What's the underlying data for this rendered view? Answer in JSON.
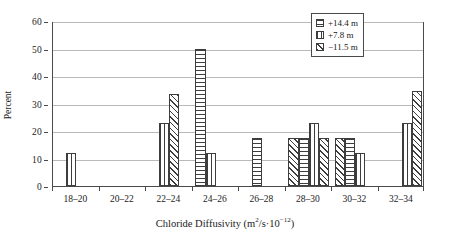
{
  "chart_data": {
    "type": "bar",
    "title": "",
    "subtitle": "",
    "xlabel_text": "Chloride Diffusivity (m2/s·10-12)",
    "xlabel_prefix": "Chloride Diffusivity (m",
    "xlabel_sup1": "2",
    "xlabel_mid": "/s",
    "xlabel_dot": "·",
    "xlabel_ten": "10",
    "xlabel_sup2": "−12",
    "xlabel_suffix": ")",
    "ylabel": "Percent",
    "categories": [
      "18–20",
      "20–22",
      "22–24",
      "24–26",
      "26–28",
      "28–30",
      "30–32",
      "32–34"
    ],
    "ylim": [
      0,
      60
    ],
    "yticks": [
      0,
      10,
      20,
      30,
      40,
      50,
      60
    ],
    "ytick_labels": [
      "0",
      "10",
      "20",
      "30",
      "40",
      "50",
      "60"
    ],
    "grid": true,
    "grid_axis": "y",
    "legend_position": "top-right",
    "series": [
      {
        "name": "+14.4 m",
        "pattern": "horizontal",
        "values": [
          0,
          0,
          0,
          50,
          17.5,
          17.5,
          17.5,
          0
        ]
      },
      {
        "name": "+7.8 m",
        "pattern": "vertical",
        "values": [
          12,
          0,
          23,
          12,
          0,
          23,
          12,
          23
        ]
      },
      {
        "name": "−11.5 m",
        "pattern": "diagonal",
        "values": [
          0,
          0,
          33.5,
          0,
          0,
          17.5,
          17.5,
          34.5
        ]
      }
    ],
    "bars": [
      {
        "group": "18–20",
        "series": "+7.8 m",
        "pattern": "vertical",
        "value": 12,
        "slot": 1
      },
      {
        "group": "22–24",
        "series": "+7.8 m",
        "pattern": "vertical",
        "value": 23,
        "slot": 1
      },
      {
        "group": "22–24",
        "series": "−11.5 m",
        "pattern": "diagonal",
        "value": 33.5,
        "slot": 2
      },
      {
        "group": "24–26",
        "series": "+14.4 m",
        "pattern": "horizontal",
        "value": 50,
        "slot": 0
      },
      {
        "group": "24–26",
        "series": "+7.8 m",
        "pattern": "vertical",
        "value": 12,
        "slot": 1
      },
      {
        "group": "26–28",
        "series": "+14.4 m",
        "pattern": "horizontal",
        "value": 17.5,
        "slot": 1
      },
      {
        "group": "28–30",
        "series": "−11.5 m",
        "pattern": "diagonal",
        "value": 17.5,
        "slot": 0
      },
      {
        "group": "28–30",
        "series": "+14.4 m",
        "pattern": "horizontal",
        "value": 17.5,
        "slot": 1
      },
      {
        "group": "28–30",
        "series": "+7.8 m",
        "pattern": "vertical",
        "value": 23,
        "slot": 2
      },
      {
        "group": "28–30",
        "series": "−11.5 m",
        "pattern": "diagonal",
        "value": 17.5,
        "slot": 3
      },
      {
        "group": "30–32",
        "series": "−11.5 m",
        "pattern": "diagonal",
        "value": 17.5,
        "slot": 0
      },
      {
        "group": "30–32",
        "series": "+14.4 m",
        "pattern": "horizontal",
        "value": 17.5,
        "slot": 1
      },
      {
        "group": "30–32",
        "series": "+7.8 m",
        "pattern": "vertical",
        "value": 12,
        "slot": 2
      },
      {
        "group": "32–34",
        "series": "+7.8 m",
        "pattern": "vertical",
        "value": 23,
        "slot": 2
      },
      {
        "group": "32–34",
        "series": "−11.5 m",
        "pattern": "diagonal",
        "value": 34.5,
        "slot": 3
      }
    ]
  },
  "legend": {
    "items": [
      {
        "label": "+14.4 m",
        "pattern": "horizontal"
      },
      {
        "label": "+7.8 m",
        "pattern": "vertical"
      },
      {
        "label": "−11.5 m",
        "pattern": "diagonal"
      }
    ]
  },
  "colors": {
    "axis": "#4a4a4a",
    "grid": "#b9b9b9",
    "bar_outline": "#3d3d3d",
    "bar_fill": "#ffffff",
    "background": "#ffffff",
    "text": "#1a1a1a"
  }
}
